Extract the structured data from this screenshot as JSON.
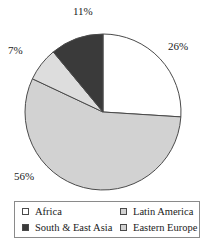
{
  "chart_data": {
    "type": "pie",
    "title": "",
    "categories": [
      "Africa",
      "Latin America",
      "Eastern Europe",
      "South & East Asia"
    ],
    "values": [
      26,
      56,
      7,
      11
    ],
    "value_labels": [
      "26%",
      "56%",
      "7%",
      "11%"
    ],
    "units": "percent",
    "start_angle_deg": 0,
    "direction": "clockwise",
    "legend_position": "bottom",
    "grid": false,
    "colors": [
      "#ffffff",
      "#d2d2d2",
      "#dddddd",
      "#3a3a3a"
    ],
    "edge_color": "#4a4a4a",
    "slices": [
      {
        "label": "Africa",
        "value": 26,
        "display": "26%",
        "color": "#ffffff"
      },
      {
        "label": "Latin America",
        "value": 56,
        "display": "56%",
        "color": "#d2d2d2"
      },
      {
        "label": "Eastern Europe",
        "value": 7,
        "display": "7%",
        "color": "#dddddd"
      },
      {
        "label": "South & East Asia",
        "value": 11,
        "display": "11%",
        "color": "#3a3a3a"
      }
    ]
  },
  "labels": {
    "africa_pct": "26%",
    "latin_pct": "56%",
    "eastern_pct": "7%",
    "south_pct": "11%"
  },
  "legend": {
    "items": [
      {
        "label": "Africa",
        "swatch": "#ffffff"
      },
      {
        "label": "Latin America",
        "swatch": "#d2d2d2"
      },
      {
        "label": "South & East Asia",
        "swatch": "#3a3a3a"
      },
      {
        "label": "Eastern Europe",
        "swatch": "#d2d2d2"
      }
    ]
  }
}
